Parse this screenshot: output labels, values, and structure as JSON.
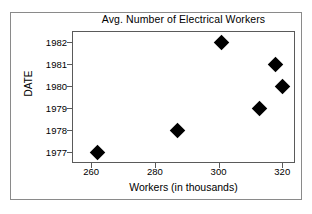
{
  "figure": {
    "title": "Avg. Number of Electrical Workers",
    "x_axis_label": "Workers (in thousands)",
    "y_axis_label": "DATE",
    "marker_color": "#000000",
    "frame_color": "#5a5a5a",
    "background_color": "#ffffff"
  },
  "chart_data": {
    "type": "scatter",
    "title": "Avg. Number of Electrical Workers",
    "xlabel": "Workers (in thousands)",
    "ylabel": "DATE",
    "xlim": [
      254,
      324
    ],
    "ylim": [
      1976.5,
      1982.5
    ],
    "y_inverted": true,
    "grid": false,
    "legend": null,
    "xticks": [
      260,
      280,
      300,
      320
    ],
    "xtick_labels": [
      "260",
      "280",
      "300",
      "320"
    ],
    "yticks": [
      1977,
      1978,
      1979,
      1980,
      1981,
      1982
    ],
    "ytick_labels": [
      "1977",
      "1978",
      "1979",
      "1980",
      "1981",
      "1982"
    ],
    "x": [
      262,
      287,
      313,
      320,
      318,
      301
    ],
    "y": [
      1977,
      1978,
      1979,
      1980,
      1981,
      1982
    ],
    "points": [
      {
        "date": 1977,
        "workers": 262
      },
      {
        "date": 1978,
        "workers": 287
      },
      {
        "date": 1979,
        "workers": 313
      },
      {
        "date": 1980,
        "workers": 320
      },
      {
        "date": 1981,
        "workers": 318
      },
      {
        "date": 1982,
        "workers": 301
      }
    ],
    "marker": "diamond",
    "marker_color": "#000000"
  }
}
